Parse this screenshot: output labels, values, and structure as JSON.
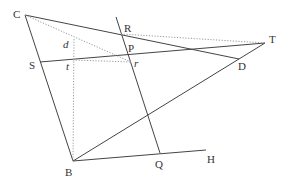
{
  "diagram": {
    "type": "geometry-construction",
    "colors": {
      "line": "#444444",
      "dotted": "#9a9a9a",
      "label": "#333333",
      "background": "#ffffff"
    },
    "points": {
      "C": {
        "label": "C",
        "x": 25,
        "y": 15
      },
      "R": {
        "label": "R",
        "x": 121,
        "y": 34
      },
      "P": {
        "label": "P",
        "x": 127,
        "y": 54
      },
      "r": {
        "label": "r",
        "x": 131,
        "y": 62
      },
      "T": {
        "label": "T",
        "x": 265,
        "y": 43
      },
      "D": {
        "label": "D",
        "x": 239,
        "y": 59
      },
      "S": {
        "label": "S",
        "x": 40,
        "y": 62
      },
      "d": {
        "label": "d",
        "x": 74,
        "y": 39
      },
      "t": {
        "label": "t",
        "x": 73,
        "y": 60
      },
      "B": {
        "label": "B",
        "x": 73,
        "y": 161
      },
      "Q": {
        "label": "Q",
        "x": 160,
        "y": 153
      },
      "H": {
        "label": "H",
        "x": 206,
        "y": 150
      }
    },
    "solid_segments": [
      "C-D",
      "C-B",
      "S-T",
      "B-T",
      "B-H",
      "line-through-R-P-Q"
    ],
    "dotted_segments": [
      "C-r",
      "R-T",
      "t-r",
      "d-B",
      "P-T"
    ]
  }
}
